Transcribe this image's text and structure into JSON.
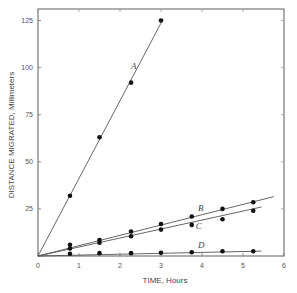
{
  "chart_data": {
    "type": "line",
    "title": "",
    "xlabel": "TIME, Hours",
    "ylabel": "DISTANCE MIGRATED, Millimeters",
    "xlim": [
      0,
      6
    ],
    "ylim": [
      0,
      130
    ],
    "xticks": [
      0,
      1,
      2,
      3,
      4,
      5,
      6
    ],
    "yticks": [
      0,
      25,
      50,
      75,
      100,
      125
    ],
    "xtick_labels": [
      "0",
      "1",
      "2",
      "3",
      "4",
      "5",
      "6"
    ],
    "ytick_labels": [
      "",
      "25",
      "50",
      "75",
      "100",
      "125"
    ],
    "grid": false,
    "legend": "inline labels",
    "series": [
      {
        "name": "A",
        "x": [
          0.78,
          1.5,
          2.27,
          3.0
        ],
        "y": [
          32,
          63,
          92,
          125
        ],
        "line_to": [
          3.05,
          125.7
        ],
        "label_pos": [
          2.27,
          99
        ]
      },
      {
        "name": "B",
        "x": [
          0.78,
          1.5,
          2.27,
          3.0,
          3.75,
          4.5,
          5.25
        ],
        "y": [
          6,
          8.5,
          13,
          17,
          21,
          25,
          28.5
        ],
        "line_to": [
          5.75,
          31.5
        ],
        "label_pos": [
          3.9,
          24
        ]
      },
      {
        "name": "C",
        "x": [
          0.78,
          1.5,
          2.27,
          3.0,
          3.75,
          4.5,
          5.25
        ],
        "y": [
          4,
          7,
          10.5,
          14,
          16.5,
          19.5,
          24
        ],
        "line_to": [
          5.45,
          26
        ],
        "label_pos": [
          3.85,
          14.5
        ]
      },
      {
        "name": "D",
        "x": [
          0.78,
          1.5,
          2.27,
          3.0,
          3.75,
          4.5,
          5.25
        ],
        "y": [
          1.2,
          1.5,
          1.5,
          1.7,
          2,
          2.5,
          2.5
        ],
        "line_to": [
          5.45,
          2.6
        ],
        "label_pos": [
          3.9,
          4.5
        ]
      }
    ]
  }
}
